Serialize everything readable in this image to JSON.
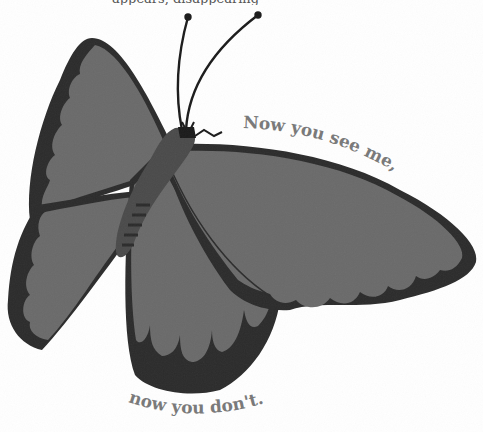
{
  "illustration": {
    "subject": "butterfly",
    "top_caption_cut": "appears, disappearing",
    "caption_top": "Now you see me,",
    "caption_bottom": "now you don't.",
    "colors": {
      "background": "#ffffff",
      "wing_fill": "#6a6a6a",
      "wing_border": "#2b2b2b",
      "body": "#4a4a4a",
      "text": "#7a7a7a"
    }
  }
}
